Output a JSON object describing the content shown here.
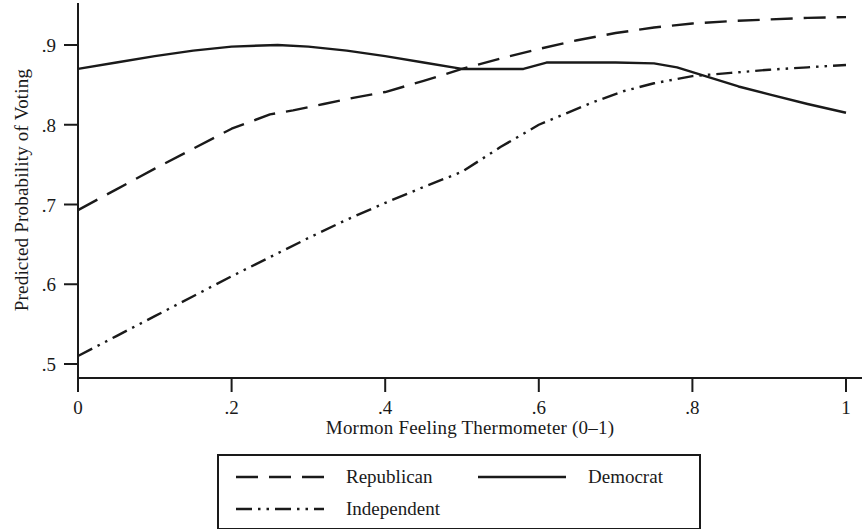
{
  "chart_data": {
    "type": "line",
    "title": "",
    "xlabel": "Mormon Feeling Thermometer (0–1)",
    "ylabel": "Predicted Probability of Voting",
    "xlim": [
      0,
      1
    ],
    "ylim": [
      0.5,
      0.94
    ],
    "grid": false,
    "xticks": [
      "0",
      ".2",
      ".4",
      ".6",
      ".8",
      "1"
    ],
    "xtick_values": [
      0,
      0.2,
      0.4,
      0.6,
      0.8,
      1
    ],
    "yticks": [
      ".5",
      ".6",
      ".7",
      ".8",
      ".9"
    ],
    "ytick_values": [
      0.5,
      0.6,
      0.7,
      0.8,
      0.9
    ],
    "legend_position": "bottom-center",
    "series": [
      {
        "name": "Republican",
        "style": "dashed",
        "color": "#1a1a1a",
        "x": [
          0.0,
          0.05,
          0.1,
          0.15,
          0.2,
          0.25,
          0.28,
          0.32,
          0.36,
          0.4,
          0.45,
          0.5,
          0.55,
          0.6,
          0.65,
          0.7,
          0.75,
          0.8,
          0.85,
          0.9,
          0.95,
          1.0
        ],
        "y": [
          0.693,
          0.719,
          0.745,
          0.77,
          0.795,
          0.813,
          0.818,
          0.826,
          0.834,
          0.841,
          0.855,
          0.87,
          0.883,
          0.895,
          0.906,
          0.915,
          0.922,
          0.927,
          0.93,
          0.932,
          0.934,
          0.935
        ]
      },
      {
        "name": "Democrat",
        "style": "solid",
        "color": "#1a1a1a",
        "x": [
          0.0,
          0.05,
          0.1,
          0.15,
          0.2,
          0.26,
          0.3,
          0.35,
          0.4,
          0.45,
          0.5,
          0.55,
          0.58,
          0.61,
          0.65,
          0.7,
          0.75,
          0.78,
          0.82,
          0.86,
          0.9,
          0.95,
          1.0
        ],
        "y": [
          0.87,
          0.878,
          0.886,
          0.893,
          0.898,
          0.9,
          0.898,
          0.893,
          0.886,
          0.878,
          0.87,
          0.87,
          0.87,
          0.878,
          0.878,
          0.878,
          0.877,
          0.872,
          0.86,
          0.848,
          0.838,
          0.826,
          0.815
        ]
      },
      {
        "name": "Independent",
        "style": "dash-dot-dot",
        "color": "#1a1a1a",
        "x": [
          0.0,
          0.05,
          0.1,
          0.15,
          0.2,
          0.25,
          0.3,
          0.35,
          0.4,
          0.45,
          0.5,
          0.55,
          0.6,
          0.63,
          0.67,
          0.71,
          0.75,
          0.8,
          0.85,
          0.9,
          0.95,
          1.0
        ],
        "y": [
          0.51,
          0.535,
          0.56,
          0.585,
          0.61,
          0.634,
          0.658,
          0.681,
          0.702,
          0.722,
          0.741,
          0.772,
          0.8,
          0.812,
          0.828,
          0.842,
          0.852,
          0.861,
          0.865,
          0.869,
          0.872,
          0.875
        ]
      }
    ]
  },
  "legend": {
    "entries": [
      {
        "label": "Republican",
        "style": "dashed"
      },
      {
        "label": "Democrat",
        "style": "solid"
      },
      {
        "label": "Independent",
        "style": "dash-dot-dot"
      }
    ]
  }
}
